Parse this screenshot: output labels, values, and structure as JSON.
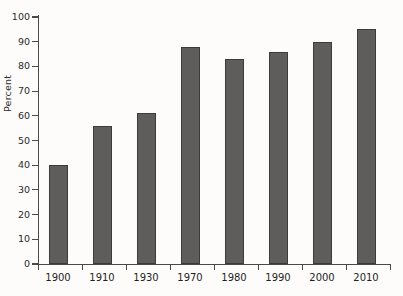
{
  "chart_data": {
    "type": "bar",
    "title": "",
    "xlabel": "",
    "ylabel": "Percent",
    "categories": [
      "1900",
      "1910",
      "1930",
      "1970",
      "1980",
      "1990",
      "2000",
      "2010"
    ],
    "values": [
      40,
      56,
      61,
      88,
      83,
      86,
      90,
      95
    ],
    "yticks": [
      0,
      10,
      20,
      30,
      40,
      50,
      60,
      70,
      80,
      90,
      100
    ],
    "ytick_labels": [
      "0",
      "10",
      "20",
      "30",
      "40",
      "50",
      "60",
      "70",
      "80",
      "90",
      "100"
    ],
    "ylim": [
      0,
      100
    ],
    "grid": false,
    "legend": null,
    "series": [
      {
        "name": "Percent",
        "values": [
          40,
          56,
          61,
          88,
          83,
          86,
          90,
          95
        ]
      }
    ],
    "bar_color": "#5f5d5b",
    "bar_edge_color": "#3d3b3a",
    "background_color": "#fdfcfa",
    "axis_color": "#4a4a4a"
  }
}
